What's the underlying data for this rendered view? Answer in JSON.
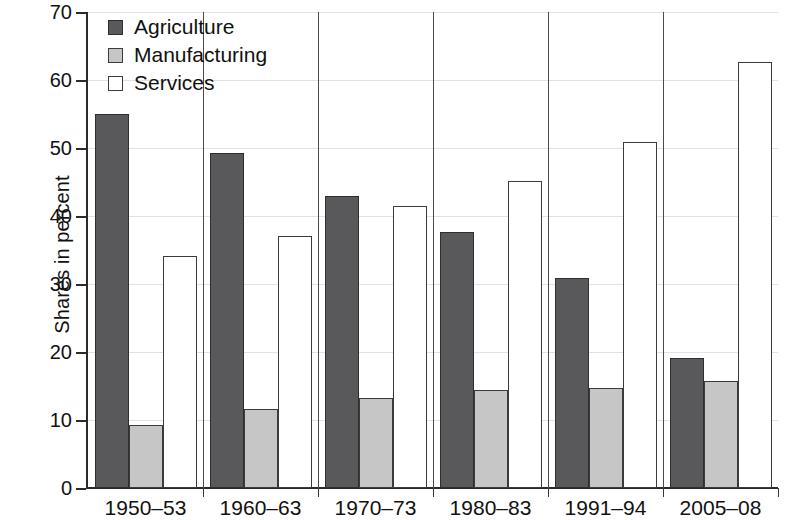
{
  "chart_data": {
    "type": "bar",
    "title": "",
    "subtitle": "",
    "xlabel": "",
    "ylabel": "Shares in percent",
    "categories": [
      "1950–53",
      "1960–63",
      "1970–73",
      "1980–83",
      "1991–94",
      "2005–08"
    ],
    "series": [
      {
        "name": "Agriculture",
        "color": "#59595b",
        "values": [
          55.0,
          49.2,
          43.0,
          37.6,
          30.9,
          19.1
        ]
      },
      {
        "name": "Manufacturing",
        "color": "#c6c6c6",
        "values": [
          9.2,
          11.6,
          13.2,
          14.4,
          14.7,
          15.8
        ]
      },
      {
        "name": "Services",
        "color": "#ffffff",
        "values": [
          34.1,
          37.0,
          41.5,
          45.1,
          50.9,
          62.6
        ]
      }
    ],
    "ylim": [
      0,
      70
    ],
    "yticks": [
      0,
      10,
      20,
      30,
      40,
      50,
      60,
      70
    ],
    "ytick_labels": [
      "0",
      "10",
      "20",
      "30",
      "40",
      "50",
      "60",
      "70"
    ],
    "grid": true,
    "grid_axis": "y",
    "legend_position": "top-left",
    "legend_entries": [
      "Agriculture",
      "Manufacturing",
      "Services"
    ]
  }
}
